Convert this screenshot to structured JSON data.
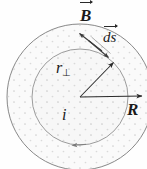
{
  "figure": {
    "kind": "ampere-law-wire-cross-section",
    "background_color": "#fefefe",
    "stroke_color": "#6d6d6d",
    "dark_stroke_color": "#2a2a2a",
    "fill_color": "#f7f7f7",
    "dot_color": "#c9c9c9",
    "center": {
      "x": 80,
      "y": 97
    },
    "outer_circle": {
      "label": "R",
      "radius": 73,
      "description": "wire outer boundary"
    },
    "inner_circle": {
      "label": "r",
      "radius": 48,
      "description": "amperian loop"
    },
    "labels": {
      "b_field": "B",
      "ds_element": "ds",
      "r_perp": "r",
      "r_perp_subscript": "⊥",
      "current": "i",
      "radius": "R"
    },
    "arrows": {
      "radius_arrow": {
        "name": "R",
        "from": {
          "x": 80,
          "y": 97
        },
        "to": {
          "x": 143,
          "y": 96
        }
      },
      "r_perp_arrow": {
        "name": "r",
        "from": {
          "x": 80,
          "y": 97
        },
        "to": {
          "x": 113,
          "y": 62
        }
      },
      "b_vector_arrow": {
        "name": "B",
        "from": {
          "x": 101,
          "y": 50
        },
        "to": {
          "x": 79,
          "y": 33
        }
      },
      "ds_vector_arrow": {
        "name": "ds",
        "from": {
          "x": 88,
          "y": 40
        },
        "to": {
          "x": 109,
          "y": 58
        }
      },
      "loop_direction_arrowhead": {
        "name": "counterclockwise",
        "at": {
          "x": 77,
          "y": 145
        }
      }
    }
  }
}
